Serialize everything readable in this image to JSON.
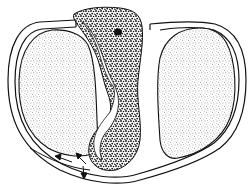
{
  "figure": {
    "kind": "anatomical-illustration",
    "style": "black-and-white stippled line drawing",
    "colors": {
      "background": "#ffffff",
      "ink": "#111111",
      "stipple_light": "#555555",
      "stipple_dark": "#1a1a1a"
    },
    "elements": {
      "outer_capsule": "outer-capsule",
      "left_lobe": "left-stippled-lobe",
      "right_lobe": "right-stippled-lobe",
      "central_mass": "central-dark-mass",
      "arrows_count": 3
    }
  }
}
